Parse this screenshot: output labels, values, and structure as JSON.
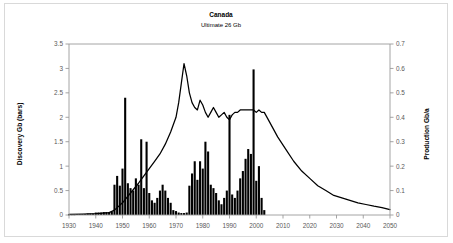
{
  "chart_data": {
    "type": "bar",
    "title": "Canada",
    "subtitle": "Ultimate 26 Gb",
    "xlabel": "",
    "ylabel": "Discovery Gb (bars)",
    "y2label": "Production Gb/a",
    "xlim": [
      1930,
      2050
    ],
    "ylim": [
      0,
      3.5
    ],
    "y2lim": [
      0,
      0.7
    ],
    "xticks": [
      1930,
      1940,
      1950,
      1960,
      1970,
      1980,
      1990,
      2000,
      2010,
      2020,
      2030,
      2040,
      2050
    ],
    "xticklabels": [
      "1930",
      "1940",
      "1950",
      "1960",
      "1970",
      "1980",
      "1990",
      "2000",
      "2010",
      "2020",
      "2030",
      "2040",
      "2050"
    ],
    "yticks": [
      0,
      0.5,
      1,
      1.5,
      2,
      2.5,
      3,
      3.5
    ],
    "yticklabels": [
      "0",
      "0.5",
      "1",
      "1.5",
      "2",
      "2.5",
      "3",
      "3.5"
    ],
    "y2ticks": [
      0,
      0.1,
      0.2,
      0.3,
      0.4,
      0.5,
      0.6,
      0.7
    ],
    "y2ticklabels": [
      "0",
      "0.1",
      "0.2",
      "0.3",
      "0.4",
      "0.5",
      "0.6",
      "0.7"
    ],
    "grid": false,
    "legend": "none",
    "bar_color": "#000000",
    "line_color": "#000000",
    "series": [
      {
        "name": "Discovery Gb (bars)",
        "kind": "bar",
        "axis": "left",
        "x": [
          1930,
          1931,
          1932,
          1933,
          1934,
          1935,
          1936,
          1937,
          1938,
          1939,
          1940,
          1941,
          1942,
          1943,
          1944,
          1945,
          1946,
          1947,
          1948,
          1949,
          1950,
          1951,
          1952,
          1953,
          1954,
          1955,
          1956,
          1957,
          1958,
          1959,
          1960,
          1961,
          1962,
          1963,
          1964,
          1965,
          1966,
          1967,
          1968,
          1969,
          1970,
          1971,
          1972,
          1973,
          1974,
          1975,
          1976,
          1977,
          1978,
          1979,
          1980,
          1981,
          1982,
          1983,
          1984,
          1985,
          1986,
          1987,
          1988,
          1989,
          1990,
          1991,
          1992,
          1993,
          1994,
          1995,
          1996,
          1997,
          1998,
          1999,
          2000,
          2001,
          2002,
          2003
        ],
        "values": [
          0.01,
          0.01,
          0.01,
          0.02,
          0.02,
          0.02,
          0.02,
          0.03,
          0.03,
          0.03,
          0.05,
          0.05,
          0.05,
          0.06,
          0.06,
          0.06,
          0.07,
          0.62,
          0.8,
          0.6,
          0.95,
          2.4,
          0.65,
          0.55,
          0.5,
          0.75,
          0.62,
          1.55,
          0.55,
          1.5,
          0.45,
          0.3,
          0.25,
          0.35,
          0.5,
          0.62,
          0.5,
          0.35,
          0.25,
          0.1,
          0.08,
          0.05,
          0.04,
          0.04,
          0.05,
          0.6,
          0.85,
          1.1,
          0.72,
          1.1,
          0.95,
          1.5,
          1.3,
          0.62,
          0.55,
          0.45,
          0.3,
          0.22,
          0.35,
          0.5,
          2.05,
          0.42,
          0.35,
          0.5,
          0.75,
          0.9,
          1.15,
          1.35,
          1.25,
          2.98,
          0.7,
          1.0,
          0.35,
          0.1
        ]
      },
      {
        "name": "Production Gb/a",
        "kind": "line",
        "axis": "right",
        "x": [
          1930,
          1935,
          1940,
          1945,
          1947,
          1950,
          1953,
          1956,
          1958,
          1960,
          1962,
          1964,
          1966,
          1968,
          1970,
          1971,
          1972,
          1973,
          1974,
          1975,
          1976,
          1977,
          1978,
          1979,
          1980,
          1981,
          1982,
          1983,
          1984,
          1985,
          1986,
          1987,
          1988,
          1989,
          1990,
          1991,
          1992,
          1993,
          1994,
          1995,
          1996,
          1997,
          1998,
          1999,
          2000,
          2001,
          2002,
          2003,
          2005,
          2008,
          2011,
          2014,
          2017,
          2020,
          2023,
          2026,
          2029,
          2032,
          2035,
          2038,
          2041,
          2044,
          2047,
          2050
        ],
        "values": [
          0.003,
          0.004,
          0.006,
          0.01,
          0.02,
          0.05,
          0.09,
          0.13,
          0.16,
          0.19,
          0.22,
          0.25,
          0.29,
          0.34,
          0.4,
          0.46,
          0.54,
          0.62,
          0.57,
          0.5,
          0.46,
          0.44,
          0.43,
          0.47,
          0.45,
          0.42,
          0.4,
          0.42,
          0.44,
          0.42,
          0.4,
          0.41,
          0.42,
          0.4,
          0.39,
          0.41,
          0.42,
          0.42,
          0.43,
          0.43,
          0.43,
          0.43,
          0.43,
          0.43,
          0.42,
          0.43,
          0.42,
          0.42,
          0.38,
          0.32,
          0.27,
          0.22,
          0.18,
          0.15,
          0.12,
          0.1,
          0.08,
          0.07,
          0.06,
          0.05,
          0.043,
          0.036,
          0.03,
          0.022
        ]
      }
    ]
  }
}
